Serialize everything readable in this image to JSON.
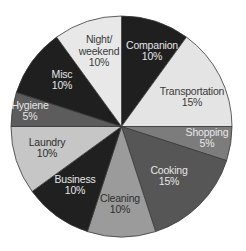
{
  "chart_data": {
    "type": "pie",
    "title": "",
    "start_angle_deg": 0,
    "direction": "clockwise",
    "center": [
      121.5,
      126.5
    ],
    "radius": 110.5,
    "legend": "none",
    "slices": [
      {
        "label": "Companion",
        "value": 10,
        "value_label": "10%",
        "color": "#1f1f1f",
        "text_color": "#e6e6e6",
        "label_pos": [
          152,
          51
        ]
      },
      {
        "label": "Transportation",
        "value": 15,
        "value_label": "15%",
        "color": "#e4e4e4",
        "text_color": "#3a3a3a",
        "label_pos": [
          192,
          97
        ]
      },
      {
        "label": "Shopping",
        "value": 5,
        "value_label": "5%",
        "color": "#7c7c7c",
        "text_color": "#e8e8e8",
        "label_pos": [
          207,
          138
        ]
      },
      {
        "label": "Cooking",
        "value": 15,
        "value_label": "15%",
        "color": "#565656",
        "text_color": "#e6e6e6",
        "label_pos": [
          169,
          176
        ]
      },
      {
        "label": "Cleaning",
        "value": 10,
        "value_label": "10%",
        "color": "#9b9b9b",
        "text_color": "#2e2e2e",
        "label_pos": [
          120,
          204
        ]
      },
      {
        "label": "Business",
        "value": 10,
        "value_label": "10%",
        "color": "#202020",
        "text_color": "#e6e6e6",
        "label_pos": [
          75,
          185
        ]
      },
      {
        "label": "Laundry",
        "value": 10,
        "value_label": "10%",
        "color": "#c6c6c6",
        "text_color": "#2e2e2e",
        "label_pos": [
          47,
          148
        ]
      },
      {
        "label": "Hygiene",
        "value": 5,
        "value_label": "5%",
        "color": "#5c5c5c",
        "text_color": "#e6e6e6",
        "label_pos": [
          30,
          111
        ]
      },
      {
        "label": "Misc",
        "value": 10,
        "value_label": "10%",
        "color": "#1f1f1f",
        "text_color": "#e6e6e6",
        "label_pos": [
          62,
          80
        ]
      },
      {
        "label": "Night/\nweekend",
        "value": 10,
        "value_label": "10%",
        "color": "#e8e8e8",
        "text_color": "#3a3a3a",
        "label_pos": [
          99,
          51
        ]
      }
    ]
  }
}
